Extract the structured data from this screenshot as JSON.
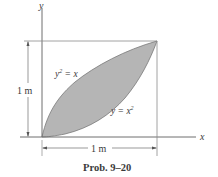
{
  "figure": {
    "caption": "Prob. 9–20",
    "axes": {
      "x_label": "x",
      "y_label": "y"
    },
    "dimensions": {
      "height_label": "1 m",
      "width_label": "1 m"
    },
    "curves": [
      {
        "equation_lhs": "y",
        "equation_exp": "2",
        "equation_rhs": " = x",
        "full": "y² = x"
      },
      {
        "equation_lhs": "y = x",
        "equation_exp": "2",
        "full": "y = x²"
      }
    ],
    "colors": {
      "fill": "#b5b5b5",
      "stroke": "#6e6e6e",
      "text": "#3a3a3a"
    }
  }
}
